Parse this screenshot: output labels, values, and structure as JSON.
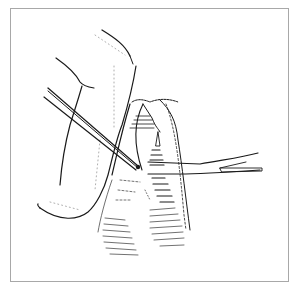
{
  "figure": {
    "kind": "surgical line illustration",
    "frame_color": "#a8a8a8",
    "ink_color": "#1a1a1a",
    "elements": [
      {
        "name": "retracted-tissue-flap",
        "description": "large curved skin flap on the left"
      },
      {
        "name": "forceps",
        "description": "long straight forceps entering from upper left"
      },
      {
        "name": "scissors",
        "description": "surgical scissors entering from right"
      },
      {
        "name": "incision-cavity",
        "description": "hatched opening with exposed structure in center"
      },
      {
        "name": "shaded-tissue",
        "description": "hatched tissue mass below the incision"
      }
    ]
  }
}
